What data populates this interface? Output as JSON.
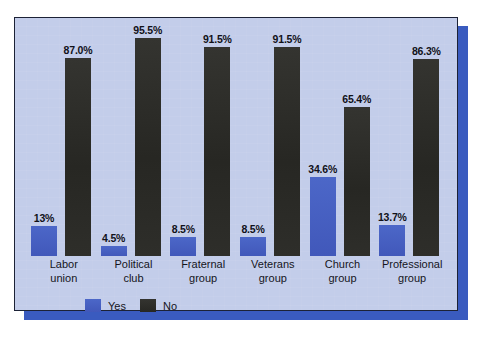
{
  "chart_data": {
    "type": "bar",
    "title": "",
    "subtitle": "",
    "xlabel": "",
    "ylabel": "",
    "ylim": [
      0,
      100
    ],
    "grid": false,
    "legend_position": "bottom-left",
    "categories": [
      "Labor union",
      "Political club",
      "Fraternal group",
      "Veterans group",
      "Church group",
      "Professional group"
    ],
    "category_lines": [
      [
        "Labor",
        "union"
      ],
      [
        "Political",
        "club"
      ],
      [
        "Fraternal",
        "group"
      ],
      [
        "Veterans",
        "group"
      ],
      [
        "Church",
        "group"
      ],
      [
        "Professional",
        "group"
      ]
    ],
    "series": [
      {
        "name": "Yes",
        "color": "#4560c0",
        "values": [
          13.0,
          4.5,
          8.5,
          8.5,
          34.6,
          13.7
        ],
        "labels": [
          "13%",
          "4.5%",
          "8.5%",
          "8.5%",
          "34.6%",
          "13.7%"
        ]
      },
      {
        "name": "No",
        "color": "#2b2b28",
        "values": [
          87.0,
          95.5,
          91.5,
          91.5,
          65.4,
          86.3
        ],
        "labels": [
          "87.0%",
          "95.5%",
          "91.5%",
          "91.5%",
          "65.4%",
          "86.3%"
        ]
      }
    ]
  },
  "legend": {
    "items": [
      {
        "label": "Yes",
        "color": "#4560c0"
      },
      {
        "label": "No",
        "color": "#2b2b28"
      }
    ]
  },
  "panel": {
    "background_color": "#c3cdea",
    "border_color": "#1c2236",
    "shadow_color": "#3a5bbf"
  }
}
